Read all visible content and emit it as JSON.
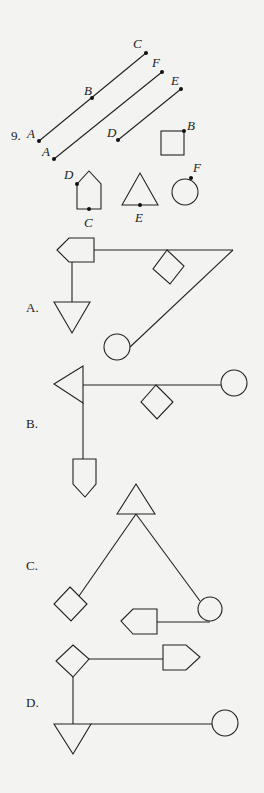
{
  "question": {
    "number": "9.",
    "point_labels": {
      "line1": [
        "A",
        "B",
        "C"
      ],
      "line2": [
        "A",
        "F"
      ],
      "line3": [
        "D",
        "E"
      ],
      "square": "B",
      "pentagon_top": "D",
      "pentagon_bottom": "C",
      "triangle": "E",
      "circle": "F"
    }
  },
  "options": [
    {
      "label": "A."
    },
    {
      "label": "B."
    },
    {
      "label": "C."
    },
    {
      "label": "D."
    }
  ]
}
